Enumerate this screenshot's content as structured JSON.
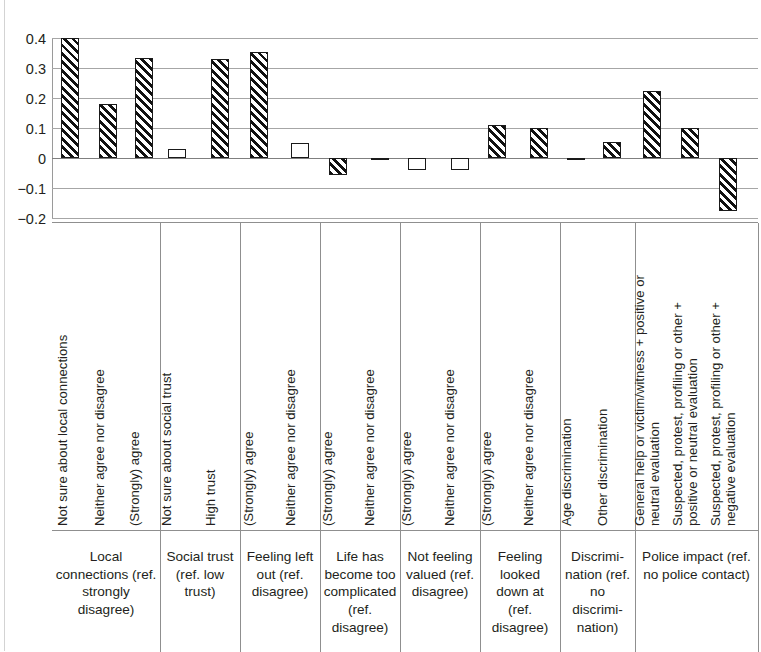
{
  "chart_data": {
    "type": "bar",
    "title": "",
    "subtitle": "",
    "xlabel": "",
    "ylabel": "",
    "ylim": [
      -0.2,
      0.4
    ],
    "yticks": [
      "0.4",
      "0.3",
      "0.2",
      "0.1",
      "0",
      "−0.1",
      "−0.2"
    ],
    "ytick_values": [
      0.4,
      0.3,
      0.2,
      0.1,
      0,
      -0.1,
      -0.2
    ],
    "grid": true,
    "legend": "none",
    "series": [
      {
        "name": "Coefficient",
        "values": [
          0.4,
          0.18,
          0.335,
          0.03,
          0.33,
          0.355,
          0.05,
          -0.055,
          -0.008,
          -0.04,
          -0.04,
          0.11,
          0.1,
          -0.005,
          0.055,
          0.225,
          0.1,
          -0.175
        ]
      }
    ],
    "categories": [
      "Not sure about local connections",
      "Neither agree nor disagree",
      "(Strongly) agree",
      "Not sure about social trust",
      "High trust",
      "(Strongly) agree",
      "Neither agree nor disagree",
      "(Strongly) agree",
      "Neither agree nor disagree",
      "(Strongly) agree",
      "Neither agree nor disagree",
      "(Strongly) agree",
      "Neither agree nor disagree",
      "Age discrimination",
      "Other discrimination",
      "General help or victim/witness + positive or neutral evaluation",
      "Suspected, protest, profiling or other + positive or neutral evaluation",
      "Suspected, protest, profiling or other + negative evaluation"
    ],
    "bar_fill": [
      "hatched",
      "hatched",
      "hatched",
      "plain",
      "hatched",
      "hatched",
      "plain",
      "hatched",
      "hatched",
      "plain",
      "plain",
      "hatched",
      "hatched",
      "hatched",
      "hatched",
      "hatched",
      "hatched",
      "hatched"
    ],
    "groups": [
      {
        "label": "Local connections (ref. strongly disagree)",
        "n_bars": 3
      },
      {
        "label": "Social trust (ref.  low trust)",
        "n_bars": 2
      },
      {
        "label": "Feeling left out (ref. disagree)",
        "n_bars": 2
      },
      {
        "label": "Life has become too complicated (ref. disagree)",
        "n_bars": 2
      },
      {
        "label": "Not feeling valued (ref. disagree)",
        "n_bars": 2
      },
      {
        "label": "Feeling looked down at (ref. disagree)",
        "n_bars": 2
      },
      {
        "label": "Discrimi-nation (ref. no discrimi-nation)",
        "n_bars": 2
      },
      {
        "label": "Police impact (ref. no police contact)",
        "n_bars": 3
      }
    ]
  },
  "yaxis": {
    "t0": "0.4",
    "t1": "0.3",
    "t2": "0.2",
    "t3": "0.1",
    "t4": "0",
    "t5": "−0.1",
    "t6": "−0.2"
  },
  "cats": {
    "c0": "Not sure about local connections",
    "c1": "Neither agree nor disagree",
    "c2": "(Strongly) agree",
    "c3": "Not sure about social trust",
    "c4": "High trust",
    "c5": "(Strongly) agree",
    "c6": "Neither agree nor disagree",
    "c7": "(Strongly) agree",
    "c8": "Neither agree nor disagree",
    "c9": "(Strongly) agree",
    "c10": "Neither agree nor disagree",
    "c11": "(Strongly) agree",
    "c12": "Neither agree nor disagree",
    "c13": "Age discrimination",
    "c14": "Other discrimination",
    "c15a": "General help or victim/witness + positive or",
    "c15b": "neutral evaluation",
    "c16a": "Suspected, protest, profiling or other +",
    "c16b": "positive or neutral evaluation",
    "c17a": "Suspected, protest, profiling or other +",
    "c17b": "negative evaluation"
  },
  "groups": {
    "g0": "Local connections (ref. strongly disagree)",
    "g1": "Social trust (ref.  low trust)",
    "g2": "Feeling left out (ref. disagree)",
    "g3": "Life has become too complicated (ref. disagree)",
    "g4": "Not feeling valued (ref. disagree)",
    "g5": "Feeling looked down at (ref. disagree)",
    "g6": "Discrimi-nation (ref. no discrimi-nation)",
    "g7": "Police impact (ref. no police contact)"
  }
}
